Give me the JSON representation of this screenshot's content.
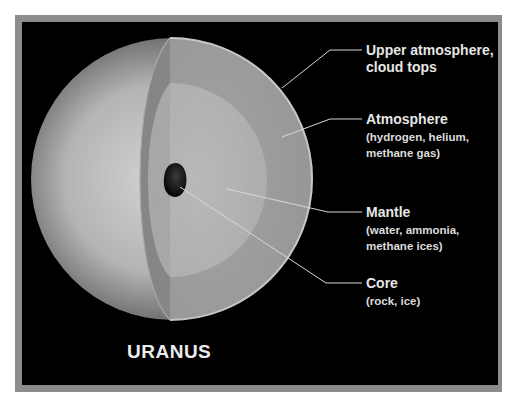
{
  "diagram": {
    "planet_name": "URANUS",
    "layers": [
      {
        "id": "upper-atmosphere",
        "title": "Upper atmosphere,",
        "subtitle": "cloud tops",
        "title_line2": "cloud tops"
      },
      {
        "id": "atmosphere",
        "title": "Atmosphere",
        "subtitle": "(hydrogen, helium, methane gas)",
        "sub_line1": "(hydrogen, helium,",
        "sub_line2": "methane gas)"
      },
      {
        "id": "mantle",
        "title": "Mantle",
        "subtitle": "(water, ammonia, methane ices)",
        "sub_line1": "(water, ammonia,",
        "sub_line2": "methane ices)"
      },
      {
        "id": "core",
        "title": "Core",
        "subtitle": "(rock, ice)",
        "sub_line1": "(rock, ice)"
      }
    ],
    "colors": {
      "background": "#000000",
      "frame": "#8c8c8c",
      "label_text": "#e6e6e6",
      "leader_line": "#d8d8d8",
      "planet_light": "#cfcfcf",
      "atmosphere_layer": "#9a9a9a",
      "mantle_layer": "#b8b8b8",
      "core": "#111111"
    }
  }
}
